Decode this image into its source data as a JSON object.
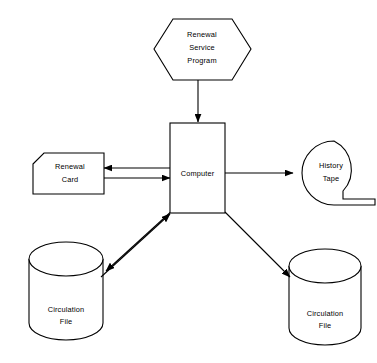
{
  "diagram": {
    "background_color": "#ffffff",
    "line_color": "#000000",
    "text_color": "#000000",
    "nodes": [
      {
        "id": "renewal-service-program",
        "shape": "hexagon",
        "lines": [
          "Renewal",
          "Service",
          "Program"
        ]
      },
      {
        "id": "computer",
        "shape": "rectangle",
        "lines": [
          "Computer"
        ]
      },
      {
        "id": "renewal-card",
        "shape": "punched-card",
        "lines": [
          "Renewal",
          "Card"
        ]
      },
      {
        "id": "history-tape",
        "shape": "magnetic-tape",
        "lines": [
          "History",
          "Tape"
        ]
      },
      {
        "id": "circulation-file-left",
        "shape": "cylinder",
        "lines": [
          "Circulation",
          "File"
        ]
      },
      {
        "id": "circulation-file-right",
        "shape": "cylinder",
        "lines": [
          "Circulation",
          "File"
        ]
      }
    ],
    "connectors": [
      {
        "id": "program-to-computer",
        "from": "renewal-service-program",
        "to": "computer",
        "direction": "down",
        "style": "single"
      },
      {
        "id": "computer-to-card",
        "from": "computer",
        "to": "renewal-card",
        "direction": "left",
        "style": "single"
      },
      {
        "id": "card-to-computer",
        "from": "renewal-card",
        "to": "computer",
        "direction": "right",
        "style": "single"
      },
      {
        "id": "computer-to-tape",
        "from": "computer",
        "to": "history-tape",
        "direction": "right",
        "style": "single"
      },
      {
        "id": "computer-to-circulation-left",
        "from": "computer",
        "to": "circulation-file-left",
        "direction": "down-left",
        "style": "single"
      },
      {
        "id": "circulation-left-to-computer",
        "from": "circulation-file-left",
        "to": "computer",
        "direction": "up-right",
        "style": "single"
      },
      {
        "id": "computer-to-circulation-right",
        "from": "computer",
        "to": "circulation-file-right",
        "direction": "down-right",
        "style": "single"
      }
    ]
  }
}
